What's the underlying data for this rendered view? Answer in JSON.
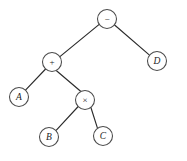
{
  "diagram": {
    "background_color": "#ffffff",
    "edge_color": "#2b2b2b",
    "node_stroke_color": "#4a4a4a",
    "node_fill_color": "#ffffff",
    "label_color": "#1d1d1d",
    "nodes": [
      {
        "id": "root",
        "label": "−",
        "kind": "operator",
        "cx": 107,
        "cy": 19,
        "r": 9.5
      },
      {
        "id": "plus",
        "label": "+",
        "kind": "operator",
        "cx": 52,
        "cy": 62,
        "r": 9.5
      },
      {
        "id": "d",
        "label": "D",
        "kind": "operand",
        "cx": 157,
        "cy": 61,
        "r": 9.5
      },
      {
        "id": "a",
        "label": "A",
        "kind": "operand",
        "cx": 19,
        "cy": 97,
        "r": 9.5
      },
      {
        "id": "times",
        "label": "×",
        "kind": "operator",
        "cx": 85,
        "cy": 100,
        "r": 9.5
      },
      {
        "id": "b",
        "label": "B",
        "kind": "operand",
        "cx": 49,
        "cy": 137,
        "r": 9.5
      },
      {
        "id": "c",
        "label": "C",
        "kind": "operand",
        "cx": 103,
        "cy": 136,
        "r": 9.5
      }
    ],
    "edges": [
      {
        "id": "root-plus",
        "from": "root",
        "to": "plus",
        "x1": 99.2,
        "y1": 24.4,
        "x2": 59.9,
        "y2": 56.6
      },
      {
        "id": "root-d",
        "from": "root",
        "to": "d",
        "x1": 114.6,
        "y1": 25.0,
        "x2": 149.5,
        "y2": 55.1
      },
      {
        "id": "plus-a",
        "from": "plus",
        "to": "a",
        "x1": 45.6,
        "y1": 69.0,
        "x2": 25.5,
        "y2": 90.1
      },
      {
        "id": "plus-times",
        "from": "plus",
        "to": "times",
        "x1": 56.5,
        "y1": 70.7,
        "x2": 80.6,
        "y2": 91.2
      },
      {
        "id": "times-b",
        "from": "times",
        "to": "c_b",
        "x1": 78.2,
        "y1": 106.5,
        "x2": 55.9,
        "y2": 130.6
      },
      {
        "id": "times-c",
        "from": "times",
        "to": "c_c",
        "x1": 90.9,
        "y1": 107.5,
        "x2": 97.3,
        "y2": 127.6
      }
    ]
  }
}
